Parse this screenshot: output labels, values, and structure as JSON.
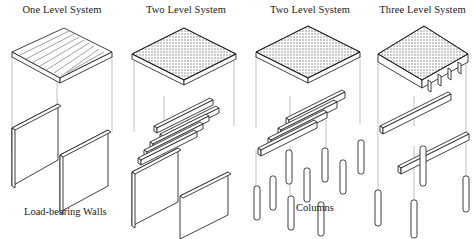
{
  "figure": {
    "kind": "exploded-isometric-structural-diagram",
    "background_color": "#ffffff",
    "line_color": "#1d1d1d",
    "shade_color": "#8c8c8c",
    "guide_color": "#9a9a9a"
  },
  "panels": [
    {
      "title": "One Level System",
      "caption": "",
      "levels": 1,
      "layers": [
        "ribbed slab",
        "load-bearing walls"
      ],
      "support": "walls",
      "wall_count": 2,
      "beam_count": 0,
      "column_count": 0,
      "slab_pattern": "ribbed lines"
    },
    {
      "title": "Two Level System",
      "caption": "",
      "levels": 2,
      "layers": [
        "shaded slab",
        "joists",
        "load-bearing walls"
      ],
      "support": "walls",
      "wall_count": 2,
      "beam_count": 5,
      "column_count": 0,
      "slab_pattern": "halftone shading"
    },
    {
      "title": "Two Level System",
      "caption": "",
      "levels": 2,
      "layers": [
        "shaded slab",
        "beams",
        "columns"
      ],
      "support": "columns",
      "wall_count": 0,
      "beam_count": 4,
      "column_count": 9,
      "slab_pattern": "halftone shading"
    },
    {
      "title": "Three Level System",
      "caption": "",
      "levels": 3,
      "layers": [
        "slab with integral joists",
        "girders",
        "columns"
      ],
      "support": "columns",
      "wall_count": 0,
      "beam_count": 2,
      "column_count": 4,
      "slab_pattern": "halftone shading with ribs"
    }
  ],
  "captions": {
    "left": "Load-bearing Walls",
    "right": "Columns"
  }
}
